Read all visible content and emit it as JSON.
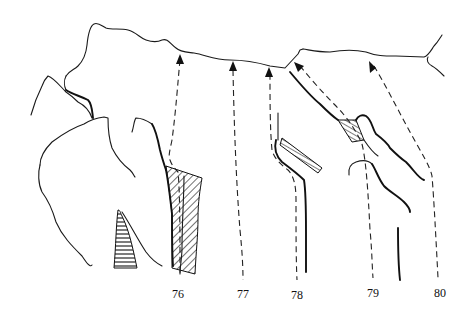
{
  "diagram": {
    "type": "climbing-route-topo",
    "routes": [
      {
        "number": "76",
        "label_x": 178,
        "label_y": 298
      },
      {
        "number": "77",
        "label_x": 243,
        "label_y": 298
      },
      {
        "number": "78",
        "label_x": 297,
        "label_y": 298
      },
      {
        "number": "79",
        "label_x": 373,
        "label_y": 297
      },
      {
        "number": "80",
        "label_x": 440,
        "label_y": 297
      }
    ],
    "colors": {
      "ink": "#111111",
      "background": "#ffffff"
    }
  }
}
